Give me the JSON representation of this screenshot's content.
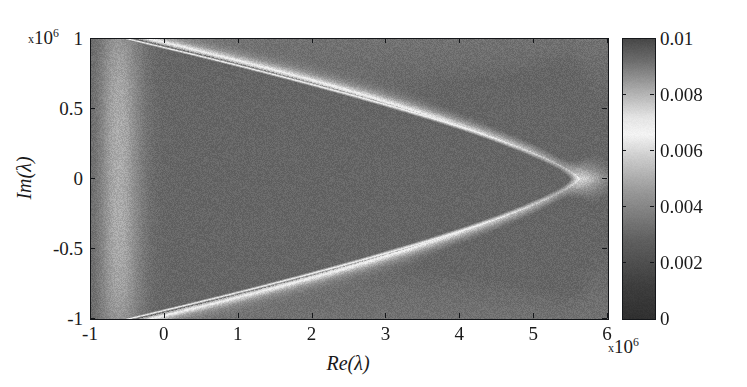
{
  "figure": {
    "title": "",
    "background": "#ffffff",
    "axis_color": "#15171a"
  },
  "axes": {
    "x_title": "Re(λ)",
    "y_title": "Im(λ)",
    "x_multiplier_prefix": "x",
    "x_multiplier_base": "10",
    "x_multiplier_exp": "6",
    "y_multiplier_prefix": "x",
    "y_multiplier_base": "10",
    "y_multiplier_exp": "6",
    "x_ticklabels": [
      "-1",
      "0",
      "1",
      "2",
      "3",
      "4",
      "5",
      "6"
    ],
    "y_ticklabels": [
      "1",
      "0.5",
      "0",
      "-0.5",
      "-1"
    ]
  },
  "colorbar": {
    "ticklabels": [
      "0.01",
      "0.008",
      "0.006",
      "0.004",
      "0.002",
      "0"
    ],
    "orientation": "vertical",
    "colormap": "grayscale-jet"
  },
  "chart_data": {
    "type": "heatmap",
    "title": "",
    "xlabel": "Re(λ)",
    "ylabel": "Im(λ)",
    "x_scale_multiplier": 1000000,
    "y_scale_multiplier": 1000000,
    "xlim": [
      -1,
      6
    ],
    "ylim": [
      -1,
      1
    ],
    "x_ticks": [
      -1,
      0,
      1,
      2,
      3,
      4,
      5,
      6
    ],
    "y_ticks": [
      -1,
      -0.5,
      0,
      0.5,
      1
    ],
    "clim": [
      0,
      0.01
    ],
    "colorbar_ticks": [
      0,
      0.002,
      0.004,
      0.006,
      0.008,
      0.01
    ],
    "grid": false,
    "legend": false,
    "colormap": "grayscale-jet",
    "envelope": {
      "cusp_x": 5.62,
      "opening_direction": "left",
      "symmetry_axis_y": 0.0,
      "top_crossings_x": [
        0.2,
        4.25
      ],
      "peak_intensity": 0.0095
    },
    "lobes": {
      "axis_y": 0.0,
      "centers_x": [
        0.55,
        1.25,
        1.9,
        2.52,
        3.1,
        3.65,
        4.12,
        4.52,
        4.86,
        5.13,
        5.33,
        5.48
      ],
      "min_values": [
        0.0008,
        0.0008,
        0.0009,
        0.0009,
        0.001,
        0.001,
        0.0011,
        0.0012,
        0.0013,
        0.0014,
        0.0016,
        0.0018
      ]
    },
    "background_level": 0.0035,
    "interior_level": 0.0012,
    "noise_amplitude": 0.00035
  }
}
